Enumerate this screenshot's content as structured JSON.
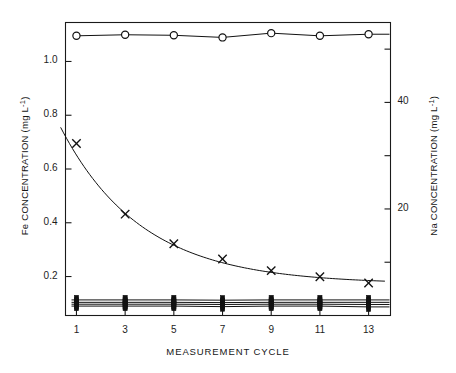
{
  "chart_data": {
    "type": "line",
    "title": "",
    "subtitle": "",
    "xlabel": "MEASUREMENT CYCLE",
    "ylabel": "Fe CONCENTRATION (mg L-1)",
    "ylabel_right": "Na CONCENTRATION (mg L-1)",
    "grid": false,
    "legend": "none",
    "x": [
      1,
      3,
      5,
      7,
      9,
      11,
      13
    ],
    "xlim": [
      0.55,
      13.9
    ],
    "ylim": [
      0.055,
      1.145
    ],
    "ylim_right": [
      0,
      55
    ],
    "xticks": [
      1,
      3,
      5,
      7,
      9,
      11,
      13
    ],
    "yticks_left": [
      0.2,
      0.4,
      0.6,
      0.8,
      1.0
    ],
    "yticks_right": [
      20,
      40
    ],
    "yticks_right_all": [
      10,
      20,
      30,
      40,
      50
    ],
    "series": [
      {
        "name": "Na (open circle)",
        "axis": "right",
        "marker": "open-circle",
        "values_right": [
          52.5,
          52.7,
          52.6,
          52.2,
          53.0,
          52.5,
          52.8
        ],
        "values": [
          1.05,
          1.054,
          1.052,
          1.044,
          1.06,
          1.05,
          1.056
        ]
      },
      {
        "name": "Fe (cross)",
        "axis": "left",
        "marker": "cross",
        "values": [
          0.695,
          0.432,
          0.322,
          0.265,
          0.222,
          0.199,
          0.176
        ]
      },
      {
        "name": "Flat series A (filled)",
        "axis": "left",
        "marker": "filled",
        "values": [
          0.113,
          0.113,
          0.113,
          0.112,
          0.113,
          0.113,
          0.113
        ]
      },
      {
        "name": "Flat series B (filled)",
        "axis": "left",
        "marker": "filled",
        "values": [
          0.104,
          0.104,
          0.104,
          0.103,
          0.104,
          0.104,
          0.104
        ]
      },
      {
        "name": "Flat series C (filled)",
        "axis": "left",
        "marker": "filled",
        "values": [
          0.097,
          0.097,
          0.097,
          0.096,
          0.097,
          0.097,
          0.096
        ]
      },
      {
        "name": "Flat series D (filled)",
        "axis": "left",
        "marker": "filled",
        "values": [
          0.09,
          0.09,
          0.09,
          0.088,
          0.09,
          0.09,
          0.087
        ]
      }
    ],
    "fit_curve": {
      "name": "Fe exponential decay fit",
      "description": "smooth decaying curve through cross markers",
      "start_value": 0.755,
      "end_value": 0.172
    }
  },
  "axes": {
    "left_title_prefix": "Fe CONCENTRATION (mg L",
    "right_title_prefix": "Na CONCENTRATION (mg L",
    "exponent": "-1",
    "title_suffix": ")",
    "x_title": "MEASUREMENT CYCLE"
  },
  "tick_text": {
    "left": [
      "1.0",
      "0.8",
      "0.6",
      "0.4",
      "0.2"
    ],
    "right": [
      "40",
      "20"
    ],
    "x": [
      "1",
      "3",
      "5",
      "7",
      "9",
      "11",
      "13"
    ]
  },
  "colors": {
    "axis": "#1a1a1a",
    "data": "#111111",
    "background": "#ffffff"
  }
}
